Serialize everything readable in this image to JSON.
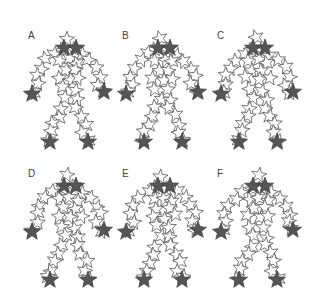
{
  "figure": {
    "panels": [
      {
        "label": "A",
        "x": 18,
        "y": 22,
        "shift": 0
      },
      {
        "label": "B",
        "x": 112,
        "y": 22,
        "shift": 1
      },
      {
        "label": "C",
        "x": 207,
        "y": 22,
        "shift": 2
      },
      {
        "label": "D",
        "x": 18,
        "y": 160,
        "shift": 3
      },
      {
        "label": "E",
        "x": 112,
        "y": 160,
        "shift": 4
      },
      {
        "label": "F",
        "x": 207,
        "y": 160,
        "shift": 5
      }
    ],
    "colors": {
      "outline_star_stroke": "#555555",
      "outline_star_fill": "#ffffff",
      "filled_star": "#555555",
      "label": "#444444"
    },
    "filled_star_positions": [
      "head-left",
      "head-right",
      "left-hand",
      "right-hand",
      "left-foot",
      "right-foot"
    ]
  }
}
